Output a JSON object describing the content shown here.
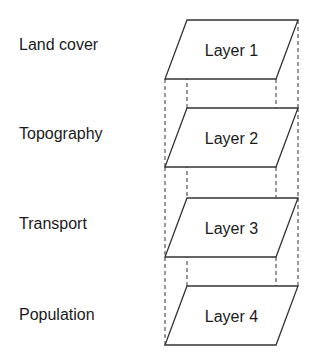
{
  "diagram": {
    "type": "layer-stack",
    "layers": [
      {
        "name": "Layer 1",
        "theme": "Land cover"
      },
      {
        "name": "Layer 2",
        "theme": "Topography"
      },
      {
        "name": "Layer 3",
        "theme": "Transport"
      },
      {
        "name": "Layer 4",
        "theme": "Population"
      }
    ],
    "colors": {
      "stroke": "#333333",
      "text": "#1a1a1a",
      "background": "#ffffff"
    }
  }
}
